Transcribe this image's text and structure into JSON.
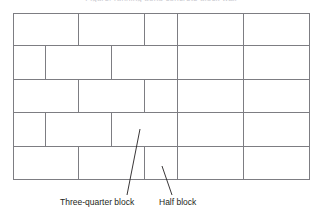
{
  "figure": {
    "title_clipped": "Figure: running bond concrete block wall",
    "wall": {
      "outline_color": "#7d7d82",
      "fill_color": "#ffffff",
      "full_block_width": 66,
      "three_quarter_block_width": 50,
      "half_block_width": 33,
      "course_height": 33,
      "course_count": 5,
      "courses": [
        {
          "name": "course-1",
          "blocks": [
            "full",
            "full",
            "half",
            "full",
            "full"
          ]
        },
        {
          "name": "course-2",
          "blocks": [
            "half",
            "full",
            "full",
            "full",
            "full",
            "half"
          ]
        },
        {
          "name": "course-3",
          "blocks": [
            "full",
            "full",
            "half",
            "full",
            "full"
          ]
        },
        {
          "name": "course-4",
          "blocks": [
            "half",
            "full",
            "full",
            "full",
            "full",
            "half"
          ]
        },
        {
          "name": "course-5",
          "blocks": [
            "full",
            "full",
            "half",
            "full",
            "full"
          ]
        }
      ]
    },
    "callouts": [
      {
        "id": "three-quarter",
        "label": "Three-quarter block"
      },
      {
        "id": "half",
        "label": "Half block"
      }
    ]
  }
}
